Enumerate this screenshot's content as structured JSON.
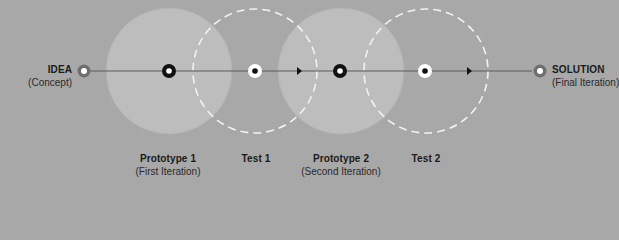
{
  "diagram": {
    "start": {
      "title": "IDEA",
      "subtitle": "(Concept)"
    },
    "end": {
      "title": "SOLUTION",
      "subtitle": "(Final Iteration)"
    },
    "stages": [
      {
        "title": "Prototype 1",
        "subtitle": "(First Iteration)",
        "type": "prototype"
      },
      {
        "title": "Test 1",
        "subtitle": "",
        "type": "test"
      },
      {
        "title": "Prototype 2",
        "subtitle": "(Second Iteration)",
        "type": "prototype"
      },
      {
        "title": "Test 2",
        "subtitle": "",
        "type": "test"
      }
    ],
    "colors": {
      "background": "#a8a8a8",
      "prototype_fill": "#bdbdbd",
      "test_stroke": "#f2f2f2",
      "line": "#5a5a5a",
      "marker_dark": "#111111",
      "endpoint": "#6e6e6e"
    }
  }
}
